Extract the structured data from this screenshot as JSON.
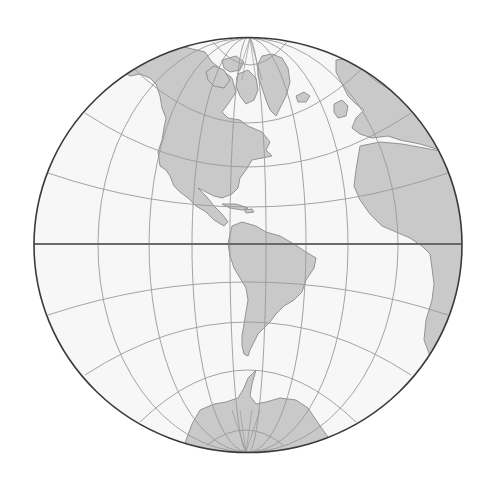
{
  "map": {
    "title": "Western Hemisphere globe projection",
    "projection": "Hemispheric (globular) projection centered on the Americas",
    "colors": {
      "background": "#ffffff",
      "ocean": "#f7f7f7",
      "land": "#c9c9c9",
      "land_outline": "#8a8a8a",
      "graticule": "#9a9a9a",
      "equator": "#6a6a6a",
      "border": "#3a3a3a"
    },
    "globe": {
      "cx": 248,
      "cy": 245,
      "rx": 214,
      "ry": 207.5
    },
    "poles": {
      "north": [
        250,
        38
      ],
      "south": [
        246,
        452
      ]
    },
    "meridians_equator_x": [
      98,
      149,
      192,
      230,
      266,
      306,
      348,
      398
    ],
    "parallels": [
      {
        "name": "north-1",
        "left": [
          213,
          42
        ],
        "right": [
          287,
          42
        ],
        "center_y": 65
      },
      {
        "name": "north-2",
        "left": [
          130,
          65
        ],
        "right": [
          366,
          65
        ],
        "center_y": 123
      },
      {
        "name": "north-3",
        "left": [
          85,
          113
        ],
        "right": [
          411,
          113
        ],
        "center_y": 167
      },
      {
        "name": "north-4",
        "left": [
          48,
          173
        ],
        "right": [
          448,
          173
        ],
        "center_y": 207
      },
      {
        "name": "south-1",
        "left": [
          48,
          315
        ],
        "right": [
          448,
          315
        ],
        "center_y": 282
      },
      {
        "name": "south-2",
        "left": [
          85,
          375
        ],
        "right": [
          411,
          375
        ],
        "center_y": 322
      },
      {
        "name": "south-3",
        "left": [
          140,
          422
        ],
        "right": [
          356,
          422
        ],
        "center_y": 370
      },
      {
        "name": "south-4",
        "left": [
          207,
          445
        ],
        "right": [
          283,
          445
        ],
        "center_y": 430
      }
    ],
    "equator_y": 244,
    "landmasses": [
      "North America",
      "Greenland",
      "South America",
      "Europe",
      "Africa",
      "Antarctica"
    ]
  }
}
